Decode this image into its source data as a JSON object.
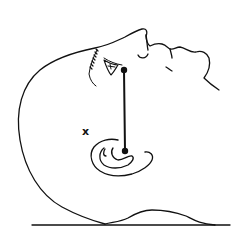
{
  "diagram": {
    "colors": {
      "stroke": "#111111",
      "background": "#ffffff"
    },
    "markers": [
      {
        "name": "eye-point",
        "x": 124,
        "y": 70
      },
      {
        "name": "ear-point",
        "x": 125,
        "y": 151
      }
    ],
    "x_mark": {
      "label": "x",
      "x": 83,
      "y": 127
    },
    "surface_line": {
      "x1": 32,
      "x2": 230,
      "y": 225
    }
  }
}
